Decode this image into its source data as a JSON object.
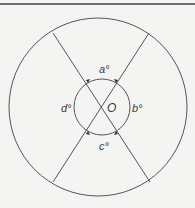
{
  "diagram": {
    "type": "geometry-circle",
    "outer_circle": {
      "cx": 98,
      "cy": 107,
      "r": 89
    },
    "inner_circle": {
      "cx": 102,
      "cy": 107,
      "r": 28
    },
    "center_label": "O",
    "lines": [
      {
        "name": "diagonal-1",
        "x1": 53,
        "y1": 33,
        "x2": 150,
        "y2": 182
      },
      {
        "name": "diagonal-2",
        "x1": 149,
        "y1": 33,
        "x2": 53,
        "y2": 182
      }
    ],
    "angles": [
      {
        "label": "a°",
        "position": "top"
      },
      {
        "label": "b°",
        "position": "right"
      },
      {
        "label": "c°",
        "position": "bottom"
      },
      {
        "label": "d°",
        "position": "left"
      }
    ],
    "colors": {
      "stroke": "#4a4a4a",
      "background": "#f4f4f2"
    }
  }
}
